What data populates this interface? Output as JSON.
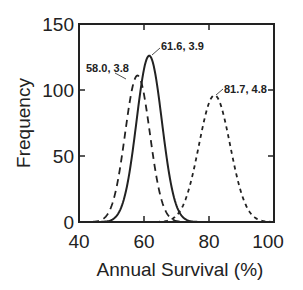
{
  "chart_data": {
    "type": "line",
    "title": "",
    "xlabel": "Annual Survival (%)",
    "ylabel": "Frequency",
    "xlim": [
      40,
      100
    ],
    "ylim": [
      0,
      150
    ],
    "xticks": [
      40,
      60,
      80,
      100
    ],
    "yticks": [
      0,
      50,
      100,
      150
    ],
    "grid": false,
    "legend": null,
    "series": [
      {
        "name": "58.0, 3.8",
        "style": "dashed",
        "mean": 58.0,
        "sd": 3.8,
        "peak": 111
      },
      {
        "name": "61.6, 3.9",
        "style": "solid",
        "mean": 61.6,
        "sd": 3.9,
        "peak": 126
      },
      {
        "name": "81.7, 4.8",
        "style": "dotted",
        "mean": 81.7,
        "sd": 4.8,
        "peak": 96
      }
    ],
    "annotations": [
      {
        "text": "58.0, 3.8",
        "x": 58.0,
        "y": 111
      },
      {
        "text": "61.6, 3.9",
        "x": 61.6,
        "y": 126
      },
      {
        "text": "81.7, 4.8",
        "x": 81.7,
        "y": 96
      }
    ]
  },
  "labels": {
    "xlabel": "Annual Survival (%)",
    "ylabel": "Frequency",
    "xticks": [
      "40",
      "60",
      "80",
      "100"
    ],
    "yticks": [
      "0",
      "50",
      "100",
      "150"
    ],
    "annot_dashed": "58.0, 3.8",
    "annot_solid": "61.6, 3.9",
    "annot_dotted": "81.7, 4.8"
  }
}
